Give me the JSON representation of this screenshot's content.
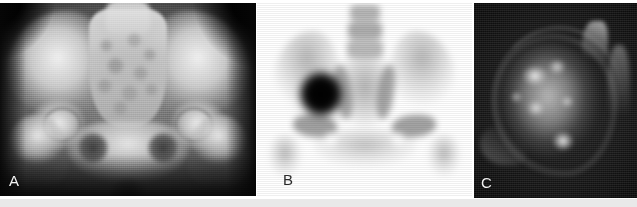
{
  "figure": {
    "type": "multi-panel-medical-imaging-figure",
    "panel_count": 3,
    "background_color": "#ffffff",
    "width_px": 637,
    "height_px": 207
  },
  "panels": [
    {
      "id": "A",
      "label": "A",
      "label_color": "#f2f2f2",
      "label_position": "bottom-left",
      "modality": "radiograph",
      "view": "anteroposterior pelvis",
      "background_color": "#0b0b0b",
      "description": "Anteroposterior pelvic radiograph showing iliac wings, sacrum, both hip joints, femoral heads and obturator foramina"
    },
    {
      "id": "B",
      "label": "B",
      "label_color": "#2a2a2a",
      "label_position": "bottom-left",
      "modality": "bone-scintigraphy",
      "view": "anterior pelvis",
      "background_color": "#ffffff",
      "description": "Bone scan in inverted grayscale showing intense focal radiotracer uptake in the right iliac bone",
      "finding": "focal-intense-uptake"
    },
    {
      "id": "C",
      "label": "C",
      "label_color": "#f2f2f2",
      "label_position": "bottom-left",
      "modality": "mri",
      "view": "axial",
      "background_color": "#060606",
      "description": "Axial fluid-sensitive MRI sequence showing a heterogeneous hyperintense lesion",
      "finding": "hyperintense-heterogeneous-lesion"
    }
  ],
  "bottom_strip": {
    "color": "#e9e9e9"
  }
}
